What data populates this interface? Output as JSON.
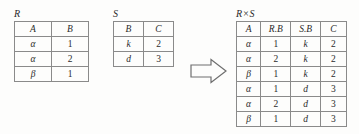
{
  "figure": {
    "type": "relational-algebra-cartesian-product",
    "arrow_icon": "block-arrow-right-icon"
  },
  "relations": [
    {
      "id": "R",
      "title": "R",
      "columns": [
        "A",
        "B"
      ],
      "rows": [
        [
          "α",
          "1"
        ],
        [
          "α",
          "2"
        ],
        [
          "β",
          "1"
        ]
      ]
    },
    {
      "id": "S",
      "title": "S",
      "columns": [
        "B",
        "C"
      ],
      "rows": [
        [
          "k",
          "2"
        ],
        [
          "d",
          "3"
        ]
      ]
    },
    {
      "id": "RS",
      "title": "R×S",
      "columns": [
        "A",
        "R.B",
        "S.B",
        "C"
      ],
      "rows": [
        [
          "α",
          "1",
          "k",
          "2"
        ],
        [
          "α",
          "2",
          "k",
          "2"
        ],
        [
          "β",
          "1",
          "k",
          "2"
        ],
        [
          "α",
          "1",
          "d",
          "3"
        ],
        [
          "α",
          "2",
          "d",
          "3"
        ],
        [
          "β",
          "1",
          "d",
          "3"
        ]
      ]
    }
  ]
}
